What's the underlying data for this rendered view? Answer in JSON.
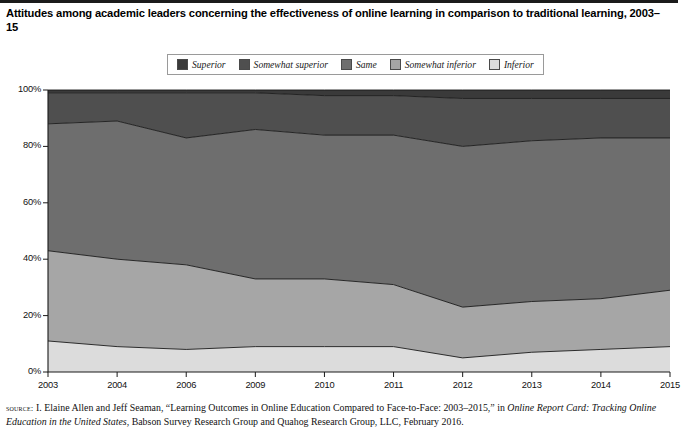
{
  "figure": {
    "title": "Attitudes among academic leaders concerning the effectiveness of online learning in comparison to traditional learning, 2003–15",
    "source_label": "source:",
    "source_line1_a": " I. Elaine Allen and Jeff Seaman, “Learning Outcomes in Online Education Compared to Face-to-Face: 2003–2015,” in ",
    "source_line1_italic": "Online Report Card:",
    "source_line2_italic": "Tracking Online Education in the United States",
    "source_line2_b": ", Babson Survey Research Group and Quahog Research Group, LLC, February 2016."
  },
  "legend": {
    "items": [
      {
        "label": "Superior",
        "color": "#3a3a3a"
      },
      {
        "label": "Somewhat superior",
        "color": "#4f4f4f"
      },
      {
        "label": "Same",
        "color": "#6e6e6e"
      },
      {
        "label": "Somewhat inferior",
        "color": "#a6a6a6"
      },
      {
        "label": "Inferior",
        "color": "#dcdcdc"
      }
    ]
  },
  "axes": {
    "y_ticks": [
      "0%",
      "20%",
      "40%",
      "60%",
      "80%",
      "100%"
    ],
    "x_ticks": [
      "2003",
      "2004",
      "2006",
      "2009",
      "2010",
      "2011",
      "2012",
      "2013",
      "2014",
      "2015"
    ]
  },
  "chart_data": {
    "type": "area",
    "stacked": true,
    "normalized": "100%",
    "title": "Attitudes among academic leaders concerning the effectiveness of online learning in comparison to traditional learning, 2003–15",
    "xlabel": "",
    "ylabel": "",
    "x": [
      "2003",
      "2004",
      "2006",
      "2009",
      "2010",
      "2011",
      "2012",
      "2013",
      "2014",
      "2015"
    ],
    "categories": [
      "2003",
      "2004",
      "2006",
      "2009",
      "2010",
      "2011",
      "2012",
      "2013",
      "2014",
      "2015"
    ],
    "ylim": [
      0,
      100
    ],
    "y_ticks": [
      0,
      20,
      40,
      60,
      80,
      100
    ],
    "grid": false,
    "legend_position": "top-center",
    "series": [
      {
        "name": "Inferior",
        "color": "#dcdcdc",
        "values": [
          11,
          9,
          8,
          9,
          9,
          9,
          5,
          7,
          8,
          9
        ]
      },
      {
        "name": "Somewhat inferior",
        "color": "#a6a6a6",
        "values": [
          32,
          31,
          30,
          24,
          24,
          22,
          18,
          18,
          18,
          20
        ]
      },
      {
        "name": "Same",
        "color": "#6e6e6e",
        "values": [
          45,
          49,
          45,
          53,
          51,
          53,
          57,
          57,
          57,
          54
        ]
      },
      {
        "name": "Somewhat superior",
        "color": "#4f4f4f",
        "values": [
          11,
          10,
          16,
          13,
          14,
          14,
          17,
          15,
          14,
          14
        ]
      },
      {
        "name": "Superior",
        "color": "#3a3a3a",
        "values": [
          1,
          1,
          1,
          1,
          2,
          2,
          3,
          3,
          3,
          3
        ]
      }
    ],
    "cumulative_boundaries": {
      "inferior_top": [
        11,
        9,
        8,
        9,
        9,
        9,
        5,
        7,
        8,
        9
      ],
      "somewhat_inferior_top": [
        43,
        40,
        38,
        33,
        33,
        31,
        23,
        25,
        26,
        29
      ],
      "same_top": [
        88,
        89,
        83,
        86,
        84,
        84,
        80,
        82,
        83,
        83
      ],
      "somewhat_superior_top": [
        99,
        99,
        99,
        99,
        98,
        98,
        97,
        97,
        97,
        97
      ],
      "superior_top": [
        100,
        100,
        100,
        100,
        100,
        100,
        100,
        100,
        100,
        100
      ]
    }
  }
}
